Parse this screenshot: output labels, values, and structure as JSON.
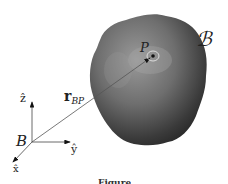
{
  "figure": {
    "body_label": "ℬ",
    "point_label": "P",
    "origin_label": "B",
    "vector_label_main": "r",
    "vector_label_sub": "BP",
    "axes": {
      "z": "ẑ",
      "y": "ŷ",
      "x": "x̂"
    },
    "caption": "Figure"
  }
}
